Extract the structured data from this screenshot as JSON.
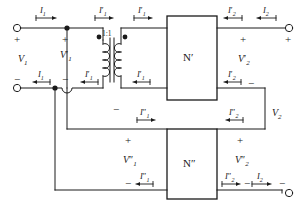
{
  "figure": {
    "line_color": "#1a1a1a",
    "text_color": "#1a1a1a",
    "background": "#ffffff"
  },
  "blocks": [
    {
      "id": "n-prime",
      "label": "N′"
    },
    {
      "id": "n-double-prime",
      "label": "N″"
    }
  ],
  "transformer": {
    "ratio_label": "1:1"
  },
  "signs": {
    "input_plus": "+",
    "input_minus": "−",
    "v1p_plus": "+",
    "v1p_minus": "−",
    "v1pp_plus": "+",
    "v1pp_minus": "−",
    "mid_minus": "−",
    "v2p_plus_left": "+",
    "v2p_plus_right": "+",
    "v2p_minus": "−",
    "v2pp_plus": "+",
    "v2pp_minus_left": "−",
    "v2pp_minus_right": "−",
    "v2_minus_top": "−"
  },
  "voltages": {
    "v1": {
      "base": "V",
      "sub": "1",
      "prime": ""
    },
    "v1p": {
      "base": "V",
      "sub": "1",
      "prime": "′"
    },
    "v1pp": {
      "base": "V",
      "sub": "1",
      "prime": "″"
    },
    "v2": {
      "base": "V",
      "sub": "2",
      "prime": ""
    },
    "v2p": {
      "base": "V",
      "sub": "2",
      "prime": "′"
    },
    "v2pp": {
      "base": "V",
      "sub": "2",
      "prime": "″"
    }
  },
  "currents": {
    "i1_top": {
      "base": "I",
      "sub": "1",
      "prime": "",
      "direction": "right"
    },
    "i1_bottom": {
      "base": "I",
      "sub": "1",
      "prime": "",
      "direction": "left"
    },
    "i1p_top": {
      "base": "I",
      "sub": "1",
      "prime": "′",
      "direction": "right"
    },
    "i1p_top2": {
      "base": "I",
      "sub": "1",
      "prime": "′",
      "direction": "right"
    },
    "i1p_bottom": {
      "base": "I",
      "sub": "1",
      "prime": "′",
      "direction": "left"
    },
    "i1p_bottom2": {
      "base": "I",
      "sub": "1",
      "prime": "′",
      "direction": "left"
    },
    "i1pp_mid": {
      "base": "I",
      "sub": "1",
      "prime": "″",
      "direction": "right"
    },
    "i1pp_bottom": {
      "base": "I",
      "sub": "1",
      "prime": "″",
      "direction": "left"
    },
    "i2p_top": {
      "base": "I",
      "sub": "2",
      "prime": "′",
      "direction": "left"
    },
    "i2_top": {
      "base": "I",
      "sub": "2",
      "prime": "",
      "direction": "left"
    },
    "i2p_lower": {
      "base": "I",
      "sub": "2",
      "prime": "′",
      "direction": "left"
    },
    "i2pp_mid": {
      "base": "I",
      "sub": "2",
      "prime": "″",
      "direction": "left"
    },
    "i2pp_bottom": {
      "base": "I",
      "sub": "2",
      "prime": "″",
      "direction": "right"
    },
    "i2_bottom": {
      "base": "I",
      "sub": "2",
      "prime": "",
      "direction": "right"
    }
  },
  "terminals": [
    {
      "id": "in-top",
      "x": 16,
      "y": 28
    },
    {
      "id": "in-bottom",
      "x": 16,
      "y": 88
    },
    {
      "id": "out-top",
      "x": 287,
      "y": 28
    },
    {
      "id": "out-bottom",
      "x": 287,
      "y": 193
    }
  ]
}
